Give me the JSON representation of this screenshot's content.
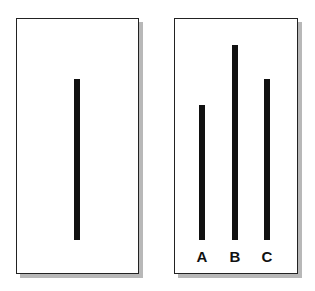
{
  "diagram": {
    "title": "",
    "reference_card": {
      "lines": [
        {
          "name": "reference",
          "top": 79,
          "bottom": 240
        }
      ]
    },
    "comparison_card": {
      "lines": [
        {
          "label": "A",
          "top": 105,
          "bottom": 240
        },
        {
          "label": "B",
          "top": 45,
          "bottom": 240
        },
        {
          "label": "C",
          "top": 79,
          "bottom": 240
        }
      ]
    }
  },
  "colors": {
    "line": "#111111",
    "border": "#222222",
    "shadow": "#b8b8b8",
    "background": "#ffffff"
  }
}
